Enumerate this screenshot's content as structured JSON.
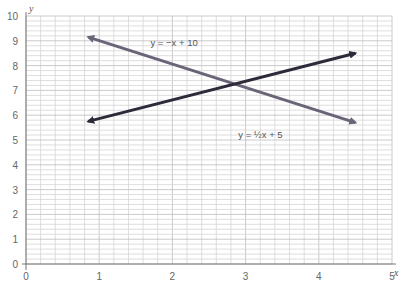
{
  "chart_data": {
    "type": "line",
    "title": "",
    "xlabel": "x",
    "ylabel": "y",
    "xlim": [
      0,
      5
    ],
    "ylim": [
      0,
      10
    ],
    "grid": true,
    "x_ticks": [
      "0",
      "1",
      "2",
      "3",
      "4",
      "5"
    ],
    "y_ticks": [
      "0",
      "1",
      "2",
      "3",
      "4",
      "5",
      "6",
      "7",
      "8",
      "9",
      "10"
    ],
    "series": [
      {
        "name": "y = −x + 10",
        "color": "#6b6478",
        "x": [
          0.85,
          4.5
        ],
        "y": [
          9.15,
          5.7
        ],
        "arrows": "both"
      },
      {
        "name": "y = ½x + 5",
        "color": "#2e2a3a",
        "x": [
          0.85,
          4.5
        ],
        "y": [
          5.75,
          8.5
        ],
        "arrows": "both"
      }
    ],
    "annotations": [
      {
        "text": "y = −x + 10",
        "x": 1.7,
        "y": 8.8
      },
      {
        "text": "y = ½x + 5",
        "x": 2.9,
        "y": 5.1
      }
    ]
  }
}
